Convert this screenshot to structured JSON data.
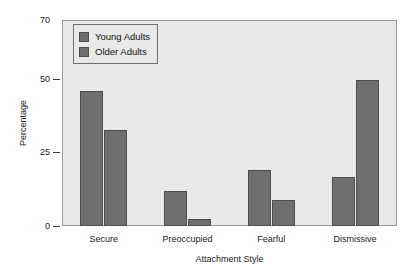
{
  "chart_data": {
    "type": "bar",
    "title": "",
    "xlabel": "Attachment Style",
    "ylabel": "Percentage",
    "categories": [
      "Secure",
      "Preoccupied",
      "Fearful",
      "Dismissive"
    ],
    "series": [
      {
        "name": "Young Adults",
        "values": [
          46,
          12,
          19,
          16.5
        ],
        "color": "#6e6e6e"
      },
      {
        "name": "Older Adults",
        "values": [
          32.5,
          2.5,
          9,
          49.5
        ],
        "color": "#6e6e6e"
      }
    ],
    "ylim": [
      0,
      70
    ],
    "yticks": [
      0,
      25,
      50,
      70
    ],
    "ytick_labels": [
      "0",
      "25",
      "50",
      "70"
    ],
    "grid": false,
    "legend_position": "upper-left-inside",
    "plot_background": "#e9e9e9",
    "page_background": "#ffffff",
    "axis_color": "#9a9a9a",
    "bar_edge_color": "#4d4d4d"
  },
  "legend": {
    "items": [
      {
        "label": "Young Adults",
        "swatch": "#6e6e6e"
      },
      {
        "label": "Older Adults",
        "swatch": "#6e6e6e"
      }
    ]
  },
  "axes": {
    "y_title": "Percentage",
    "x_title": "Attachment Style",
    "y_tick_labels": [
      "70",
      "50",
      "25",
      "0"
    ],
    "x_tick_labels": [
      "Secure",
      "Preoccupied",
      "Fearful",
      "Dismissive"
    ]
  }
}
